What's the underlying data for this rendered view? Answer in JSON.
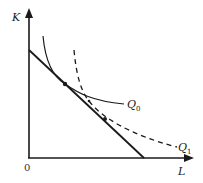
{
  "diagram": {
    "type": "isoquant-isocost",
    "axes": {
      "y_label": "K",
      "x_label": "L",
      "origin_label": "0"
    },
    "curves": [
      {
        "name": "isoquant-q0",
        "label": "Q",
        "subscript": "0",
        "style": "solid"
      },
      {
        "name": "isoquant-q1",
        "label": "Q",
        "subscript": "1",
        "style": "dashed"
      }
    ],
    "budget_line": {
      "style": "solid",
      "description": "isocost line"
    },
    "points": [
      {
        "name": "tangency-point",
        "x": 65,
        "y": 84
      },
      {
        "name": "point-mid",
        "x": 89,
        "y": 101
      },
      {
        "name": "point-lower",
        "x": 105,
        "y": 119
      }
    ],
    "colors": {
      "ink": "#1a1a1a",
      "background": "#ffffff"
    }
  }
}
